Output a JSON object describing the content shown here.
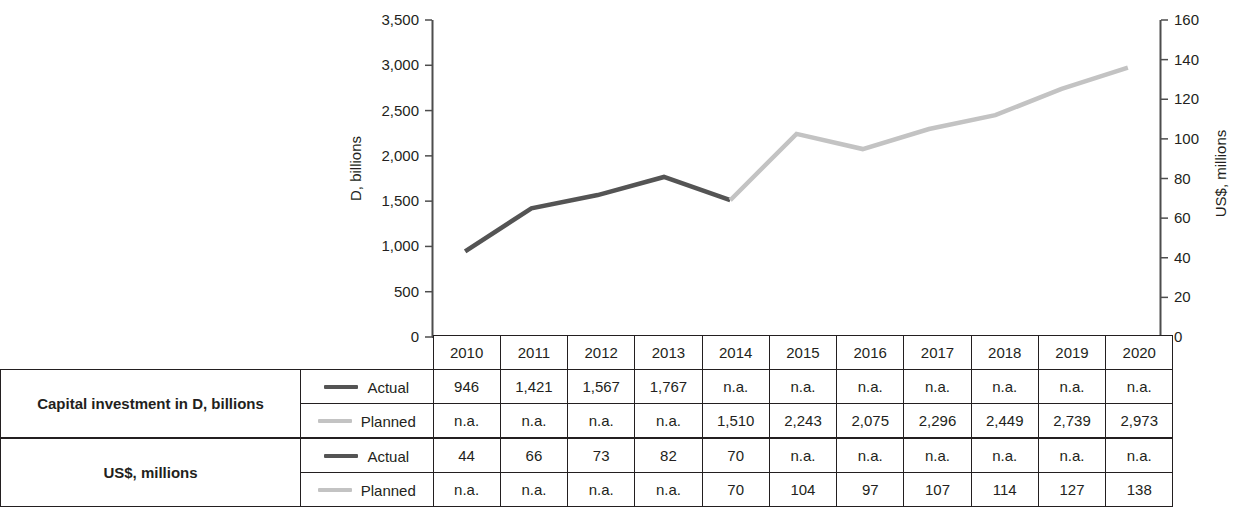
{
  "chart_data": {
    "type": "line",
    "title": "",
    "xlabel": "",
    "categories": [
      "2010",
      "2011",
      "2012",
      "2013",
      "2014",
      "2015",
      "2016",
      "2017",
      "2018",
      "2019",
      "2020"
    ],
    "left_axis": {
      "label": "D, billions",
      "ticks": [
        "0",
        "500",
        "1,000",
        "1,500",
        "2,000",
        "2,500",
        "3,000",
        "3,500"
      ],
      "tick_values": [
        0,
        500,
        1000,
        1500,
        2000,
        2500,
        3000,
        3500
      ],
      "min": 0,
      "max": 3500
    },
    "right_axis": {
      "label": "US$, millions",
      "ticks": [
        "0",
        "20",
        "40",
        "60",
        "80",
        "100",
        "120",
        "140",
        "160"
      ],
      "tick_values": [
        0,
        20,
        40,
        60,
        80,
        100,
        120,
        140,
        160
      ],
      "min": 0,
      "max": 160
    },
    "grid": false,
    "legend_position": "table",
    "series": [
      {
        "name": "Actual",
        "color": "#545454",
        "axis": "left",
        "values": [
          946,
          1421,
          1567,
          1767,
          1510,
          null,
          null,
          null,
          null,
          null,
          null
        ]
      },
      {
        "name": "Planned",
        "color": "#c3c3c3",
        "axis": "left",
        "values": [
          null,
          null,
          null,
          null,
          1510,
          2243,
          2075,
          2296,
          2449,
          2739,
          2973
        ]
      }
    ]
  },
  "table": {
    "year_header": [
      "2010",
      "2011",
      "2012",
      "2013",
      "2014",
      "2015",
      "2016",
      "2017",
      "2018",
      "2019",
      "2020"
    ],
    "groups": [
      {
        "label": "Capital investment in D, billions",
        "rows": [
          {
            "series": "Actual",
            "swatch": "actual",
            "values": [
              "946",
              "1,421",
              "1,567",
              "1,767",
              "n.a.",
              "n.a.",
              "n.a.",
              "n.a.",
              "n.a.",
              "n.a.",
              "n.a."
            ]
          },
          {
            "series": "Planned",
            "swatch": "planned",
            "values": [
              "n.a.",
              "n.a.",
              "n.a.",
              "n.a.",
              "1,510",
              "2,243",
              "2,075",
              "2,296",
              "2,449",
              "2,739",
              "2,973"
            ]
          }
        ]
      },
      {
        "label": "US$, millions",
        "rows": [
          {
            "series": "Actual",
            "swatch": "actual",
            "values": [
              "44",
              "66",
              "73",
              "82",
              "70",
              "n.a.",
              "n.a.",
              "n.a.",
              "n.a.",
              "n.a.",
              "n.a."
            ]
          },
          {
            "series": "Planned",
            "swatch": "planned",
            "values": [
              "n.a.",
              "n.a.",
              "n.a.",
              "n.a.",
              "70",
              "104",
              "97",
              "107",
              "114",
              "127",
              "138"
            ]
          }
        ]
      }
    ]
  },
  "colors": {
    "actual": "#545454",
    "planned": "#c3c3c3",
    "axis": "#4d4d4d",
    "text": "#231f20"
  }
}
